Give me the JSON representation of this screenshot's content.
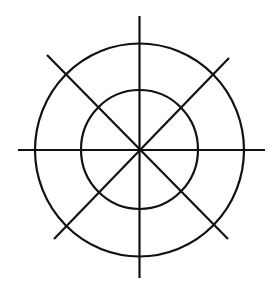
{
  "diagram": {
    "circles": [
      {
        "id": "inner-circle",
        "role": "inner ring"
      },
      {
        "id": "outer-circle",
        "role": "outer ring"
      }
    ],
    "lines": [
      {
        "id": "horizontal-axis",
        "orientation": "horizontal"
      },
      {
        "id": "vertical-axis",
        "orientation": "vertical"
      },
      {
        "id": "diagonal-descending",
        "orientation": "diagonal (top-left to bottom-right)"
      },
      {
        "id": "diagonal-ascending",
        "orientation": "diagonal (bottom-left to top-right)"
      }
    ],
    "colors": {
      "stroke": "#111111",
      "background": "#ffffff"
    }
  }
}
